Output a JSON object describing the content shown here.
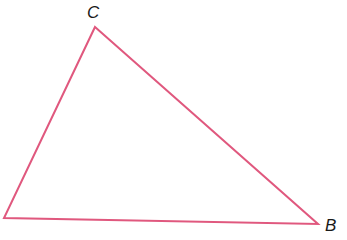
{
  "diagram": {
    "type": "triangle",
    "stroke_color": "#e0587e",
    "stroke_width": 2,
    "vertices": [
      {
        "name": "C",
        "x": 95,
        "y": 27,
        "label": "C"
      },
      {
        "name": "B",
        "x": 318,
        "y": 224,
        "label": "B"
      },
      {
        "name": "A",
        "x": 4,
        "y": 218,
        "label": ""
      }
    ],
    "labels": {
      "c": "C",
      "b": "B"
    },
    "points": "95,27 318,224 4,218"
  }
}
